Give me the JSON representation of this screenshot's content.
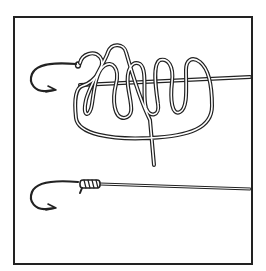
{
  "figure": {
    "type": "line-art illustration",
    "panels": [
      {
        "id": "step-1",
        "description": "hook with line passed through eye, tag end wrapped in loose coils around standing line"
      },
      {
        "id": "step-2",
        "description": "hook with finished tightened knot at eye and standing line"
      }
    ],
    "colors": {
      "ink": "#222222",
      "background": "#ffffff"
    }
  }
}
